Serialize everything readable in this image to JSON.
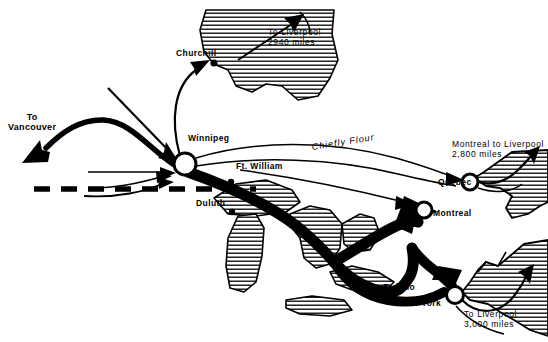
{
  "map": {
    "title": "Grain and flour shipping routes of North America",
    "colors": {
      "ink": "#000000",
      "background": "#ffffff",
      "hatch": "#000000",
      "node_fill": "#ffffff"
    },
    "cities": [
      {
        "id": "churchill",
        "label": "Churchill",
        "x": 176,
        "y": 55,
        "dot_x": 214,
        "dot_y": 63,
        "marker": "dot"
      },
      {
        "id": "winnipeg",
        "label": "Winnipeg",
        "x": 188,
        "y": 140,
        "dot_x": 185,
        "dot_y": 164,
        "marker": "circle"
      },
      {
        "id": "ft-william",
        "label": "Ft. William",
        "x": 236,
        "y": 168,
        "dot_x": 231,
        "dot_y": 182,
        "marker": "dot"
      },
      {
        "id": "duluth",
        "label": "Duluth",
        "x": 196,
        "y": 205,
        "dot_x": 232,
        "dot_y": 212,
        "marker": "dot"
      },
      {
        "id": "quebec",
        "label": "Quebec",
        "x": 438,
        "y": 184,
        "dot_x": 470,
        "dot_y": 182,
        "marker": "circle"
      },
      {
        "id": "montreal",
        "label": "Montreal",
        "x": 433,
        "y": 215,
        "dot_x": 424,
        "dot_y": 210,
        "marker": "circle"
      },
      {
        "id": "buffalo",
        "label": "Buffalo",
        "x": 383,
        "y": 289,
        "dot_x": 377,
        "dot_y": 289,
        "marker": "dot"
      },
      {
        "id": "new-york",
        "label": "New York",
        "x": 400,
        "y": 305,
        "dot_x": 455,
        "dot_y": 295,
        "marker": "circle"
      }
    ],
    "route_labels": [
      {
        "id": "to-vancouver",
        "lines": [
          "To",
          "Vancouver"
        ],
        "x": 8,
        "y": 118,
        "style": "dest"
      },
      {
        "id": "to-liverpool-hudson",
        "lines": [
          "To Liverpool",
          "2940 miles"
        ],
        "x": 268,
        "y": 33,
        "style": "note"
      },
      {
        "id": "chiefly-flour",
        "lines": [
          "Chiefly Flour"
        ],
        "x": 311,
        "y": 148,
        "style": "flour"
      },
      {
        "id": "montreal-liverpool",
        "lines": [
          "Montreal to Liverpool",
          "2,800 miles"
        ],
        "x": 452,
        "y": 146,
        "style": "note"
      },
      {
        "id": "to-liverpool-ny",
        "lines": [
          "To Liverpool",
          "3,000 miles"
        ],
        "x": 490,
        "y": 316,
        "style": "note"
      }
    ],
    "legend": {
      "border_line": "dashed international boundary",
      "heavy_flow": "major grain movement",
      "thin_flow": "secondary / flour movement"
    }
  }
}
